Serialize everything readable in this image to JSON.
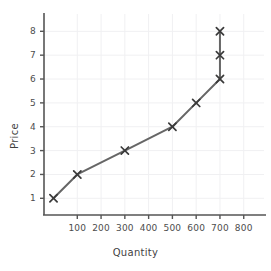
{
  "chart_data": {
    "type": "line",
    "title": "",
    "xlabel": "Quantity",
    "ylabel": "Price",
    "xlim": [
      -40,
      860
    ],
    "ylim": [
      0.3,
      8.6
    ],
    "grid": true,
    "legend": null,
    "marker": "x",
    "line_color": "#666666",
    "marker_color": "#3a3a3a",
    "grid_color": "#f0f0f2",
    "axis_color": "#555555",
    "xticks": [
      100,
      200,
      300,
      400,
      500,
      600,
      700,
      800
    ],
    "xtick_labels": [
      "100",
      "200",
      "300",
      "400",
      "500",
      "600",
      "700",
      "800"
    ],
    "yticks": [
      1,
      2,
      3,
      4,
      5,
      6,
      7,
      8
    ],
    "ytick_labels": [
      "1",
      "2",
      "3",
      "4",
      "5",
      "6",
      "7",
      "8"
    ],
    "series": [
      {
        "name": "Supply",
        "x": [
          0,
          100,
          300,
          500,
          600,
          700,
          700,
          700
        ],
        "y": [
          1,
          2,
          3,
          4,
          5,
          6,
          7,
          8
        ]
      }
    ],
    "points": [
      {
        "x": 0,
        "y": 1
      },
      {
        "x": 100,
        "y": 2
      },
      {
        "x": 300,
        "y": 3
      },
      {
        "x": 500,
        "y": 4
      },
      {
        "x": 600,
        "y": 5
      },
      {
        "x": 700,
        "y": 6
      },
      {
        "x": 700,
        "y": 7
      },
      {
        "x": 700,
        "y": 8
      }
    ]
  }
}
